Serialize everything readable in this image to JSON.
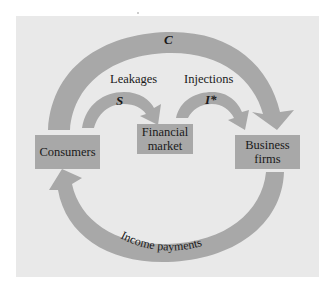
{
  "diagram": {
    "colors": {
      "panel": "#e9e9e9",
      "arrow": "#a8a8a8",
      "box": "#a8a8a8",
      "text": "#1a1a1a"
    },
    "nodes": [
      {
        "id": "consumers",
        "label": "Consumers"
      },
      {
        "id": "financial_market",
        "label_line1": "Financial",
        "label_line2": "market"
      },
      {
        "id": "business_firms",
        "label_line1": "Business",
        "label_line2": "firms"
      }
    ],
    "edges": [
      {
        "id": "consumption",
        "from": "consumers",
        "to": "business_firms",
        "symbol": "C"
      },
      {
        "id": "saving",
        "from": "consumers",
        "to": "financial_market",
        "symbol": "S",
        "group_label": "Leakages"
      },
      {
        "id": "investment",
        "from": "financial_market",
        "to": "business_firms",
        "symbol": "I*",
        "group_label": "Injections"
      },
      {
        "id": "income",
        "from": "business_firms",
        "to": "consumers",
        "label": "Income payments"
      }
    ]
  }
}
